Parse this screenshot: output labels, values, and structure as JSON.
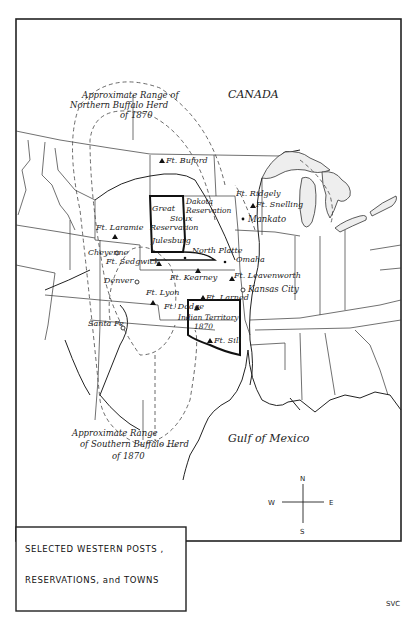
{
  "map": {
    "title_lines": [
      "SELECTED WESTERN POSTS ,",
      "RESERVATIONS, and TOWNS"
    ],
    "signature": "SVC",
    "regions": {
      "canada": "CANADA",
      "gulf": "Gulf of Mexico"
    },
    "annotations": {
      "northern_range": [
        "Approximate Range of",
        "Northern Buffalo Herd",
        "of 1870"
      ],
      "southern_range": [
        "Approximate Range",
        "of Southern Buffalo Herd",
        "of 1870"
      ]
    },
    "reservations": {
      "great_sioux": [
        "Great",
        "Sioux",
        "Reservation"
      ],
      "dakota": [
        "Dakota",
        "Reservation"
      ],
      "indian_territory": [
        "Indian Territory",
        "1870"
      ]
    },
    "forts": [
      {
        "name": "Ft. Buford"
      },
      {
        "name": "Ft. Ridgely"
      },
      {
        "name": "Ft. Snelling"
      },
      {
        "name": "Ft. Laramie"
      },
      {
        "name": "Ft. Sedgwick"
      },
      {
        "name": "Ft. Kearney"
      },
      {
        "name": "Ft. Leavenworth"
      },
      {
        "name": "Ft. Lyon"
      },
      {
        "name": "Ft. Larned"
      },
      {
        "name": "Ft. Dodge"
      },
      {
        "name": "Ft. Sill"
      }
    ],
    "towns": [
      {
        "name": "Mankato"
      },
      {
        "name": "Cheyenne"
      },
      {
        "name": "Julesburg"
      },
      {
        "name": "North Platte"
      },
      {
        "name": "Omaha"
      },
      {
        "name": "Denver"
      },
      {
        "name": "Kansas City"
      },
      {
        "name": "Santa Fe"
      }
    ],
    "compass": {
      "n": "N",
      "s": "S",
      "e": "E",
      "w": "W"
    }
  }
}
